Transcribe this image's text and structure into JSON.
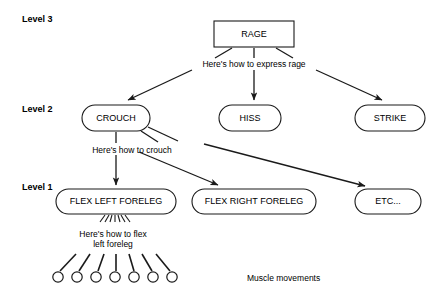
{
  "diagram": {
    "background_color": "#ffffff",
    "line_color": "#1a1a1a",
    "levels": [
      {
        "id": "level-3",
        "label": "Level 3",
        "x": 22,
        "y": 17
      },
      {
        "id": "level-2",
        "label": "Level 2",
        "x": 22,
        "y": 108
      },
      {
        "id": "level-1",
        "label": "Level 1",
        "x": 22,
        "y": 184
      }
    ],
    "nodes": [
      {
        "id": "rage",
        "label": "RAGE",
        "shape": "rect",
        "x": 214,
        "y": 21,
        "w": 80,
        "h": 26,
        "rx": 0
      },
      {
        "id": "crouch",
        "label": "CROUCH",
        "shape": "rounded",
        "x": 82,
        "y": 105,
        "w": 68,
        "h": 26,
        "rx": 13
      },
      {
        "id": "hiss",
        "label": "HISS",
        "shape": "rounded",
        "x": 219,
        "y": 105,
        "w": 62,
        "h": 26,
        "rx": 13
      },
      {
        "id": "strike",
        "label": "STRIKE",
        "shape": "rounded",
        "x": 355,
        "y": 105,
        "w": 70,
        "h": 26,
        "rx": 13
      },
      {
        "id": "flex-left-foreleg",
        "label": "FLEX LEFT FORELEG",
        "shape": "rounded",
        "x": 56,
        "y": 189,
        "w": 120,
        "h": 25,
        "rx": 12.5
      },
      {
        "id": "flex-right-foreleg",
        "label": "FLEX RIGHT FORELEG",
        "shape": "rounded",
        "x": 192,
        "y": 189,
        "w": 124,
        "h": 25,
        "rx": 12.5
      },
      {
        "id": "etc",
        "label": "ETC...",
        "shape": "rounded",
        "x": 355,
        "y": 189,
        "w": 66,
        "h": 25,
        "rx": 12.5
      }
    ],
    "edge_labels": [
      {
        "id": "express-rage",
        "text": "Here's how to express rage",
        "x": 254,
        "y": 64
      },
      {
        "id": "how-to-crouch",
        "text": "Here's how to crouch",
        "x": 132,
        "y": 150
      },
      {
        "id": "how-to-flex-line1",
        "text": "Here's how to flex",
        "x": 113,
        "y": 234
      },
      {
        "id": "how-to-flex-line2",
        "text": "left foreleg",
        "x": 113,
        "y": 244
      }
    ],
    "captions": [
      {
        "id": "muscle-movements",
        "text": "Muscle movements",
        "x": 247,
        "y": 278
      }
    ],
    "edges": [
      {
        "id": "rage-to-crouch",
        "from": "rage",
        "to": "crouch",
        "arrow": true
      },
      {
        "id": "rage-to-hiss",
        "from": "rage",
        "to": "hiss",
        "arrow": true
      },
      {
        "id": "rage-to-strike",
        "from": "rage",
        "to": "strike",
        "arrow": true
      },
      {
        "id": "crouch-to-flex-left",
        "from": "crouch",
        "to": "flex-left-foreleg",
        "arrow": true
      },
      {
        "id": "crouch-to-flex-right",
        "from": "crouch",
        "to": "flex-right-foreleg",
        "arrow": true
      },
      {
        "id": "crouch-to-etc",
        "from": "crouch",
        "to": "etc",
        "arrow": true
      }
    ],
    "muscle_movements": {
      "count": 7,
      "circle_radius": 5,
      "circle_center_y": 277,
      "circle_centers_x": [
        58,
        77,
        96,
        115,
        134,
        153,
        172
      ]
    }
  }
}
